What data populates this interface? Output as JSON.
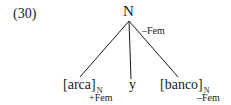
{
  "example": {
    "number": "(30)"
  },
  "tree": {
    "root": {
      "label": "N",
      "feature": "–Fem"
    },
    "leaves": [
      {
        "text": "[arca]",
        "subscript": "N",
        "feature": "+Fem"
      },
      {
        "text": "y"
      },
      {
        "text": "[banco]",
        "subscript": "N",
        "feature": "–Fem"
      }
    ]
  },
  "colors": {
    "ink": "#1a1a1a",
    "background": "#ffffff"
  }
}
